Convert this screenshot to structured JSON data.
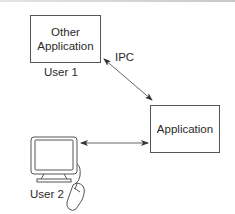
{
  "diagram": {
    "nodes": {
      "other_application": {
        "label_line1": "Other",
        "label_line2": "Application",
        "caption": "User 1"
      },
      "application": {
        "label": "Application"
      },
      "user2_workstation": {
        "caption": "User 2",
        "icon": "computer-monitor-with-mouse"
      }
    },
    "edges": {
      "ipc": {
        "label": "IPC",
        "from": "Other Application",
        "to": "Application",
        "direction": "bidirectional"
      },
      "user2_link": {
        "label": "",
        "from": "User 2",
        "to": "Application",
        "direction": "bidirectional"
      }
    },
    "colors": {
      "stroke": "#555555",
      "text": "#2a2a2a",
      "background": "#ffffff"
    }
  }
}
